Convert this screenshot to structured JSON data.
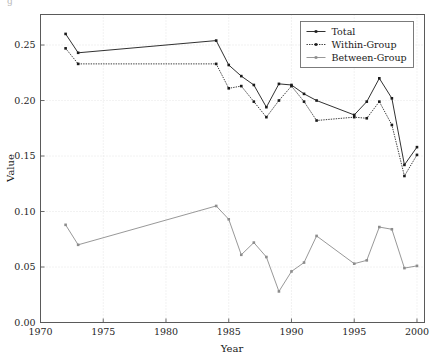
{
  "chart_data": {
    "type": "line",
    "title": "",
    "xlabel": "Year",
    "ylabel": "Value",
    "xlim": [
      1970,
      2000.6
    ],
    "ylim": [
      0.0,
      0.2775
    ],
    "grid": true,
    "legend_position": "top-right",
    "xticks": [
      1970,
      1975,
      1980,
      1985,
      1990,
      1995,
      2000
    ],
    "xtick_labels": [
      "1970",
      "1975",
      "1980",
      "1985",
      "1990",
      "1995",
      "2000"
    ],
    "yticks": [
      0.0,
      0.05,
      0.1,
      0.15,
      0.2,
      0.25
    ],
    "ytick_labels": [
      "0.00",
      "0.05",
      "0.10",
      "0.15",
      "0.20",
      "0.25"
    ],
    "series": [
      {
        "name": "Total",
        "color": "#1a1a1a",
        "linestyle": "solid",
        "marker": "point",
        "x": [
          1972,
          1973,
          1984,
          1985,
          1986,
          1987,
          1988,
          1989,
          1990,
          1991,
          1992,
          1995,
          1996,
          1997,
          1998,
          1999,
          2000
        ],
        "values": [
          0.26,
          0.243,
          0.254,
          0.232,
          0.222,
          0.214,
          0.194,
          0.215,
          0.214,
          0.206,
          0.2,
          0.187,
          0.199,
          0.22,
          0.202,
          0.142,
          0.158
        ]
      },
      {
        "name": "Within-Group",
        "color": "#1a1a1a",
        "linestyle": "dotted",
        "marker": "point",
        "x": [
          1972,
          1973,
          1984,
          1985,
          1986,
          1987,
          1988,
          1989,
          1990,
          1991,
          1992,
          1995,
          1996,
          1997,
          1998,
          1999,
          2000
        ],
        "values": [
          0.247,
          0.233,
          0.233,
          0.211,
          0.213,
          0.199,
          0.185,
          0.2,
          0.213,
          0.199,
          0.182,
          0.185,
          0.184,
          0.199,
          0.178,
          0.132,
          0.151
        ]
      },
      {
        "name": "Between-Group",
        "color": "#8c8c8c",
        "linestyle": "solid",
        "marker": "point",
        "x": [
          1972,
          1973,
          1984,
          1985,
          1986,
          1987,
          1988,
          1989,
          1990,
          1991,
          1992,
          1995,
          1996,
          1997,
          1998,
          1999,
          2000
        ],
        "values": [
          0.088,
          0.07,
          0.105,
          0.093,
          0.061,
          0.072,
          0.059,
          0.028,
          0.046,
          0.054,
          0.078,
          0.053,
          0.056,
          0.086,
          0.084,
          0.049,
          0.051
        ]
      }
    ]
  },
  "legend": {
    "entries": [
      {
        "label": "Total"
      },
      {
        "label": "Within-Group"
      },
      {
        "label": "Between-Group"
      }
    ]
  },
  "artifacts": {
    "top_left_glyph": "g"
  }
}
